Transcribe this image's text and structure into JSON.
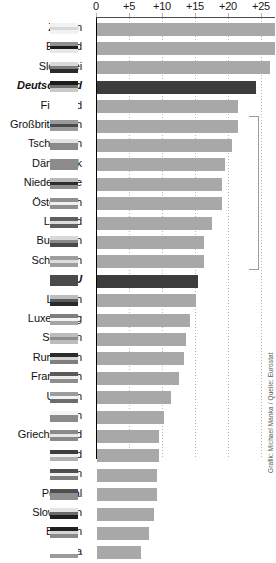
{
  "chart_data": {
    "type": "bar",
    "orientation": "horizontal",
    "title": "",
    "subtitle": "",
    "xlabel": "",
    "ylabel": "",
    "xlim": [
      0,
      27.1
    ],
    "grid": true,
    "grid_axis": "x",
    "grid_style": "dotted",
    "legend": "none",
    "xticks": [
      0,
      5,
      10,
      15,
      20,
      25
    ],
    "xticklabels": [
      "0",
      "+5",
      "+10",
      "+15",
      "+20",
      "+25"
    ],
    "categories": [
      "Zypern",
      "Estland",
      "Slowakei",
      "Deutschland",
      "Finnland",
      "Großbritannien",
      "Tschechien",
      "Dänemark",
      "Niederlande",
      "Österreich",
      "Lettland",
      "Bulgarien",
      "Schweden",
      "EU",
      "Litauen",
      "Luxemburg",
      "Spanien",
      "Rumänien",
      "Frankreich",
      "Ungarn",
      "Polen",
      "Griechenland",
      "Irland",
      "Italien",
      "Portugal",
      "Slowenien",
      "Belgien",
      "Malta"
    ],
    "values": [
      27.1,
      27.1,
      26.3,
      24.2,
      21.5,
      21.5,
      20.6,
      19.6,
      19.1,
      19.1,
      17.6,
      16.4,
      16.4,
      15.4,
      15.2,
      14.3,
      13.6,
      13.4,
      12.6,
      11.4,
      10.3,
      9.6,
      9.5,
      9.3,
      9.2,
      8.8,
      8.1,
      6.8
    ],
    "highlighted": [
      "Deutschland",
      "EU"
    ],
    "colors": {
      "bar": "#a8a8a8",
      "bar_highlight": "#3c3c3c",
      "axis": "#000000",
      "gridline": "#b5b5b5",
      "text": "#111111",
      "background": "#ffffff"
    },
    "annotations": [
      {
        "name": "group-bracket",
        "from_category": "Großbritannien",
        "to_category": "Schweden"
      }
    ]
  },
  "credit": {
    "text": "Grafik: Michael Manka / Quelle: Eurostat"
  },
  "flags": [
    {
      "country": "Zypern",
      "stripes": [
        "#f2f2f2",
        "#d8d8d8",
        "#f2f2f2"
      ]
    },
    {
      "country": "Estland",
      "stripes": [
        "#8f8f8f",
        "#1c1c1c",
        "#e8e8e8"
      ]
    },
    {
      "country": "Slowakei",
      "stripes": [
        "#d9d9d9",
        "#7d7d7d",
        "#2b2b2b"
      ]
    },
    {
      "country": "Deutschland",
      "stripes": [
        "#1c1c1c",
        "#6f6f6f",
        "#c9c9c9"
      ]
    },
    {
      "country": "Finnland",
      "stripes": [
        "#ffffff",
        "#ffffff",
        "#ffffff"
      ]
    },
    {
      "country": "Großbritannien",
      "stripes": [
        "#9a9a9a",
        "#4a4a4a",
        "#9a9a9a"
      ]
    },
    {
      "country": "Tschechien",
      "stripes": [
        "#e2e2e2",
        "#8a8a8a",
        "#8a8a8a"
      ]
    },
    {
      "country": "Dänemark",
      "stripes": [
        "#8c8c8c",
        "#8c8c8c",
        "#8c8c8c"
      ]
    },
    {
      "country": "Niederlande",
      "stripes": [
        "#b9b9b9",
        "#2e2e2e",
        "#8d8d8d"
      ]
    },
    {
      "country": "Österreich",
      "stripes": [
        "#8f8f8f",
        "#efefef",
        "#8f8f8f"
      ]
    },
    {
      "country": "Lettland",
      "stripes": [
        "#5f5f5f",
        "#dcdcdc",
        "#5f5f5f"
      ]
    },
    {
      "country": "Bulgarien",
      "stripes": [
        "#d8d8d8",
        "#8a8a8a",
        "#4a4a4a"
      ]
    },
    {
      "country": "Schweden",
      "stripes": [
        "#9e9e9e",
        "#dddddd",
        "#9e9e9e"
      ]
    },
    {
      "country": "EU",
      "stripes": [
        "#4a4a4a",
        "#4a4a4a",
        "#4a4a4a"
      ]
    },
    {
      "country": "Litauen",
      "stripes": [
        "#bdbdbd",
        "#5c5c5c",
        "#2a2a2a"
      ]
    },
    {
      "country": "Luxemburg",
      "stripes": [
        "#7e7e7e",
        "#f2f2f2",
        "#a5a5a5"
      ]
    },
    {
      "country": "Spanien",
      "stripes": [
        "#bcbcbc",
        "#8d8d8d",
        "#bcbcbc"
      ]
    },
    {
      "country": "Rumänien",
      "stripes": [
        "#2b2b2b",
        "#d5d5d5",
        "#7f7f7f"
      ]
    },
    {
      "country": "Frankreich",
      "stripes": [
        "#5a5a5a",
        "#ededed",
        "#8e8e8e"
      ]
    },
    {
      "country": "Ungarn",
      "stripes": [
        "#9c9c9c",
        "#f2f2f2",
        "#6d6d6d"
      ]
    },
    {
      "country": "Polen",
      "stripes": [
        "#f4f4f4",
        "#8b8b8b",
        "#8b8b8b"
      ]
    },
    {
      "country": "Griechenland",
      "stripes": [
        "#8a8a8a",
        "#e6e6e6",
        "#8a8a8a"
      ]
    },
    {
      "country": "Irland",
      "stripes": [
        "#3d3d3d",
        "#f0f0f0",
        "#b0b0b0"
      ]
    },
    {
      "country": "Italien",
      "stripes": [
        "#4f4f4f",
        "#f0f0f0",
        "#7d7d7d"
      ]
    },
    {
      "country": "Portugal",
      "stripes": [
        "#4f4f4f",
        "#8f8f8f",
        "#8f8f8f"
      ]
    },
    {
      "country": "Slowenien",
      "stripes": [
        "#e4e4e4",
        "#6a6a6a",
        "#1f1f1f"
      ]
    },
    {
      "country": "Belgien",
      "stripes": [
        "#1f1f1f",
        "#d5d5d5",
        "#8a8a8a"
      ]
    },
    {
      "country": "Malta",
      "stripes": [
        "#ffffff",
        "#ffffff",
        "#9a9a9a"
      ]
    }
  ]
}
